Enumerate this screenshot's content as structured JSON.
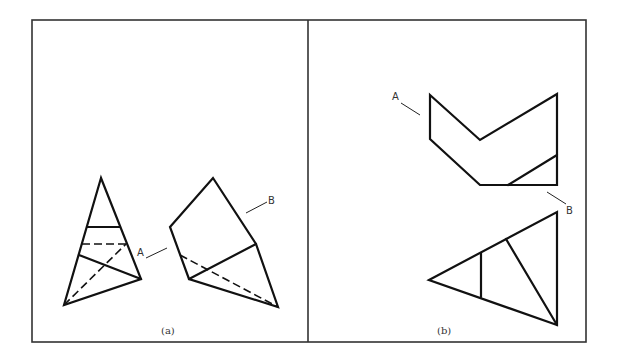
{
  "figure": {
    "panels": [
      {
        "id": "a",
        "caption": "(a)",
        "labels": [
          {
            "text": "A",
            "target": "interior plane of pyramid"
          },
          {
            "text": "B",
            "target": "face of unfolded solid"
          }
        ]
      },
      {
        "id": "b",
        "caption": "(b)",
        "labels": [
          {
            "text": "A",
            "target": "upper chevron-shaped piece"
          },
          {
            "text": "B",
            "target": "lower triangular piece"
          }
        ]
      }
    ],
    "colors": {
      "line": "#111111",
      "frame": "#333333",
      "background": "#ffffff"
    }
  }
}
